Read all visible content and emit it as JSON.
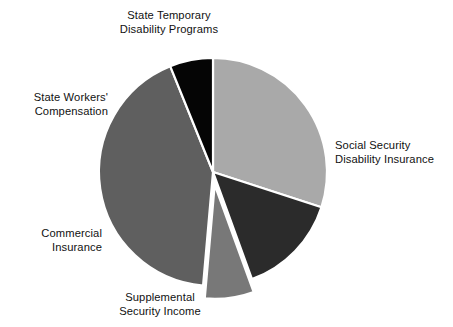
{
  "chart_data": {
    "type": "pie",
    "title": "",
    "subtitle": "",
    "xlabel": "",
    "ylabel": "",
    "legend_position": "none",
    "grid": false,
    "labels_placement": "outside-callout-free",
    "categories": [
      "Social Security Disability Insurance",
      "Supplemental Security Income",
      "Commercial Insurance",
      "State Workers' Compensation",
      "State Temporary Disability Programs"
    ],
    "values": [
      30.0,
      14.5,
      7.0,
      42.5,
      6.0
    ],
    "colors": [
      "#a9a9a9",
      "#2b2b2b",
      "#787878",
      "#5f5f5f",
      "#050505"
    ],
    "exploded": [
      false,
      false,
      true,
      false,
      false
    ],
    "start_angle_deg": 0,
    "direction": "clockwise",
    "slices": [
      {
        "name": "Social Security Disability Insurance",
        "label_line_1": "Social Security",
        "label_line_2": "Disability Insurance",
        "value": 30.0,
        "color": "#a9a9a9",
        "start_deg": 0,
        "end_deg": 108,
        "exploded": false
      },
      {
        "name": "Supplemental Security Income",
        "label_line_1": "Supplemental",
        "label_line_2": "Security Income",
        "value": 14.5,
        "color": "#2b2b2b",
        "start_deg": 108,
        "end_deg": 160,
        "exploded": false
      },
      {
        "name": "Commercial Insurance",
        "label_line_1": "Commercial",
        "label_line_2": "Insurance",
        "value": 7.0,
        "color": "#787878",
        "start_deg": 160,
        "end_deg": 185,
        "exploded": true
      },
      {
        "name": "State Workers' Compensation",
        "label_line_1": "State Workers'",
        "label_line_2": "Compensation",
        "value": 42.5,
        "color": "#5f5f5f",
        "start_deg": 185,
        "end_deg": 338,
        "exploded": false
      },
      {
        "name": "State Temporary Disability Programs",
        "label_line_1": "State Temporary",
        "label_line_2": "Disability Programs",
        "value": 6.0,
        "color": "#050505",
        "start_deg": 338,
        "end_deg": 360,
        "exploded": false
      }
    ],
    "geometry": {
      "center_x": 213,
      "center_y": 172,
      "radius": 114,
      "explode_offset": 13,
      "separator_color": "#ffffff",
      "separator_width": 2.2,
      "background": "#ffffff"
    }
  }
}
